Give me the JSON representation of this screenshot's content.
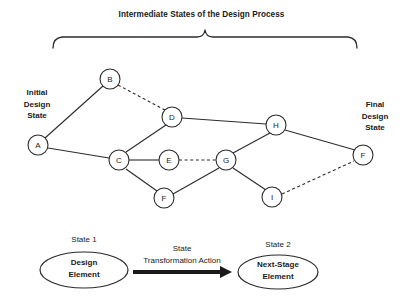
{
  "diagram": {
    "title": "Intermediate States of the Design Process",
    "left_label": "Initial\nDesign\nState",
    "left_label_lines": [
      "Initial",
      "Design",
      "State"
    ],
    "right_label": "Final\nDesign\nState",
    "right_label_lines": [
      "Final",
      "Design",
      "State"
    ],
    "stroke_color": "#2b2b2b",
    "node_fill": "#ffffff",
    "nodes": [
      {
        "id": "A",
        "label": "A",
        "x": 38,
        "y": 145,
        "r": 10
      },
      {
        "id": "B",
        "label": "B",
        "x": 110,
        "y": 79,
        "r": 10
      },
      {
        "id": "C",
        "label": "C",
        "x": 119,
        "y": 160,
        "r": 10
      },
      {
        "id": "D",
        "label": "D",
        "x": 172,
        "y": 117,
        "r": 10
      },
      {
        "id": "E",
        "label": "E",
        "x": 169,
        "y": 160,
        "r": 10
      },
      {
        "id": "F1",
        "label": "F",
        "x": 164,
        "y": 198,
        "r": 10
      },
      {
        "id": "G",
        "label": "G",
        "x": 226,
        "y": 160,
        "r": 10
      },
      {
        "id": "H",
        "label": "H",
        "x": 276,
        "y": 125,
        "r": 10
      },
      {
        "id": "I",
        "label": "I",
        "x": 272,
        "y": 197,
        "r": 10
      },
      {
        "id": "F2",
        "label": "F",
        "x": 363,
        "y": 155,
        "r": 10
      }
    ],
    "edges": [
      {
        "from": "A",
        "to": "B",
        "style": "solid"
      },
      {
        "from": "A",
        "to": "C",
        "style": "solid"
      },
      {
        "from": "B",
        "to": "D",
        "style": "dashed"
      },
      {
        "from": "C",
        "to": "D",
        "style": "solid"
      },
      {
        "from": "C",
        "to": "E",
        "style": "solid"
      },
      {
        "from": "C",
        "to": "F1",
        "style": "solid"
      },
      {
        "from": "D",
        "to": "H",
        "style": "solid"
      },
      {
        "from": "E",
        "to": "G",
        "style": "dashed"
      },
      {
        "from": "F1",
        "to": "G",
        "style": "solid"
      },
      {
        "from": "G",
        "to": "H",
        "style": "solid"
      },
      {
        "from": "G",
        "to": "I",
        "style": "solid"
      },
      {
        "from": "H",
        "to": "F2",
        "style": "solid"
      },
      {
        "from": "I",
        "to": "F2",
        "style": "dashed"
      }
    ],
    "brace": {
      "left_x": 52,
      "right_x": 358,
      "peak_x": 205,
      "base_y": 45,
      "peak_y": 30
    }
  },
  "legend": {
    "state1_label": "State 1",
    "state2_label": "State 2",
    "left_ellipse_lines": [
      "Design",
      "Element"
    ],
    "right_ellipse_lines": [
      "Next-Stage",
      "Element"
    ],
    "action_lines": [
      "State",
      "Transformation Action"
    ]
  }
}
